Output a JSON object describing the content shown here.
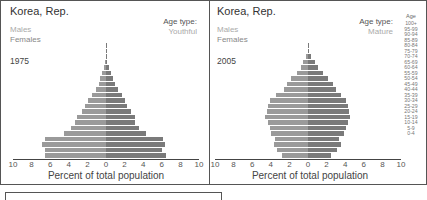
{
  "chart_data": [
    {
      "type": "bar",
      "orientation": "horizontal-population-pyramid",
      "title": "Korea, Rep.",
      "year": "1975",
      "age_type_label": "Age type:",
      "age_type": "Youthful",
      "legend": [
        "Males",
        "Females"
      ],
      "xlabel": "Percent of total population",
      "xticks": [
        "10",
        "8",
        "6",
        "4",
        "2",
        "0",
        "2",
        "4",
        "6",
        "8",
        "10"
      ],
      "xlim": [
        -10,
        10
      ],
      "categories": [
        "0-4",
        "5-9",
        "10-14",
        "15-19",
        "20-24",
        "25-29",
        "30-34",
        "35-39",
        "40-44",
        "45-49",
        "50-54",
        "55-59",
        "60-64",
        "65-69",
        "70-74",
        "75-79",
        "80-84",
        "85-89",
        "90-94",
        "95-99",
        "100+"
      ],
      "series": [
        {
          "name": "Males",
          "values": [
            6.6,
            6.6,
            6.9,
            6.6,
            4.5,
            3.8,
            3.3,
            3.1,
            2.6,
            2.3,
            1.9,
            1.5,
            1.1,
            0.8,
            0.6,
            0.4,
            0.2,
            0.1,
            0.05,
            0.02,
            0.01
          ]
        },
        {
          "name": "Females",
          "values": [
            6.4,
            6.0,
            6.3,
            6.1,
            4.3,
            3.5,
            3.1,
            3.1,
            2.7,
            2.3,
            2.0,
            1.7,
            1.3,
            1.0,
            0.8,
            0.5,
            0.3,
            0.15,
            0.07,
            0.03,
            0.01
          ]
        }
      ]
    },
    {
      "type": "bar",
      "orientation": "horizontal-population-pyramid",
      "title": "Korea, Rep.",
      "year": "2005",
      "age_type_label": "Age type:",
      "age_type": "Mature",
      "legend": [
        "Males",
        "Females"
      ],
      "xlabel": "Percent of total population",
      "xticks": [
        "10",
        "8",
        "6",
        "4",
        "2",
        "0",
        "2",
        "4",
        "6",
        "8",
        "10"
      ],
      "xlim": [
        -10,
        10
      ],
      "categories": [
        "0-4",
        "5-9",
        "10-14",
        "15-19",
        "20-24",
        "25-29",
        "30-34",
        "35-39",
        "40-44",
        "45-49",
        "50-54",
        "55-59",
        "60-64",
        "65-69",
        "70-74",
        "75-79",
        "80-84",
        "85-89",
        "90-94",
        "95-99",
        "100+"
      ],
      "series": [
        {
          "name": "Males",
          "values": [
            2.8,
            3.3,
            3.7,
            3.5,
            4.0,
            4.1,
            4.3,
            4.6,
            4.4,
            4.3,
            4.1,
            3.4,
            2.6,
            2.3,
            1.8,
            1.2,
            0.8,
            0.5,
            0.2,
            0.05,
            0.01
          ]
        },
        {
          "name": "Females",
          "values": [
            2.5,
            3.1,
            3.5,
            3.3,
            3.9,
            4.1,
            4.3,
            4.5,
            4.4,
            4.3,
            4.1,
            3.5,
            3.0,
            2.7,
            2.2,
            1.6,
            1.1,
            0.7,
            0.3,
            0.1,
            0.02
          ]
        }
      ]
    }
  ],
  "age_axis": {
    "header": "Age",
    "labels": [
      "100+",
      "95-99",
      "90-94",
      "85-89",
      "80-84",
      "75-79",
      "70-74",
      "65-69",
      "60-64",
      "55-59",
      "50-54",
      "45-49",
      "40-44",
      "35-39",
      "30-34",
      "25-29",
      "20-24",
      "15-19",
      "10-14",
      "5-9",
      "0-4"
    ]
  }
}
